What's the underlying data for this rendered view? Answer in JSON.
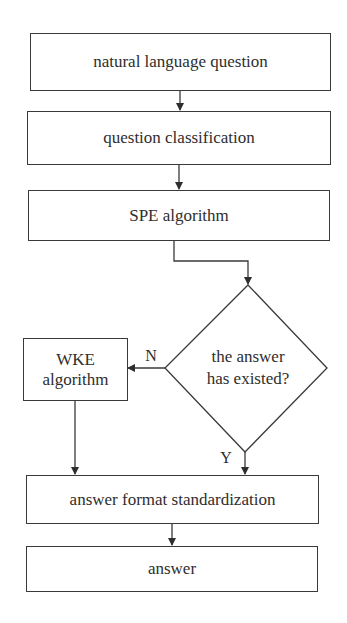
{
  "diagram": {
    "type": "flowchart",
    "nodes": {
      "n1": {
        "label": "natural language question",
        "shape": "rectangle"
      },
      "n2": {
        "label": "question classification",
        "shape": "rectangle"
      },
      "n3": {
        "label": "SPE algorithm",
        "shape": "rectangle"
      },
      "d1": {
        "line1": "the answer",
        "line2": "has existed?",
        "shape": "diamond"
      },
      "n4": {
        "line1": "WKE",
        "line2": "algorithm",
        "shape": "rectangle"
      },
      "n5": {
        "label": "answer format standardization",
        "shape": "rectangle"
      },
      "n6": {
        "label": "answer",
        "shape": "rectangle"
      }
    },
    "edge_labels": {
      "no": "N",
      "yes": "Y"
    },
    "edges": [
      {
        "from": "n1",
        "to": "n2"
      },
      {
        "from": "n2",
        "to": "n3"
      },
      {
        "from": "n3",
        "to": "d1"
      },
      {
        "from": "d1",
        "to": "n4",
        "label": "N"
      },
      {
        "from": "d1",
        "to": "n5",
        "label": "Y"
      },
      {
        "from": "n4",
        "to": "n5"
      },
      {
        "from": "n5",
        "to": "n6"
      }
    ],
    "colors": {
      "stroke": "#3a3a3a",
      "text": "#2e2e2e",
      "background": "#ffffff"
    }
  }
}
